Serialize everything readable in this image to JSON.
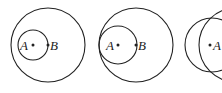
{
  "diagram": {
    "figures": [
      {
        "id": "fig-1",
        "labels": {
          "a": "A",
          "b": "B"
        }
      },
      {
        "id": "fig-2",
        "labels": {
          "a": "A",
          "b": "B"
        }
      },
      {
        "id": "fig-3",
        "labels": {
          "a": "A"
        }
      }
    ]
  }
}
